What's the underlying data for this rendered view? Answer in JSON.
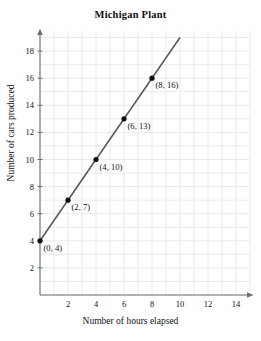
{
  "chart_data": {
    "type": "scatter",
    "title": "Michigan Plant",
    "xlabel": "Number of hours elapsed",
    "ylabel": "Number of cars produced",
    "xlim": [
      0,
      15
    ],
    "ylim": [
      0,
      19.5
    ],
    "grid": true,
    "grid_step": 1,
    "legend": "none",
    "x_ticks": [
      2,
      4,
      6,
      8,
      10,
      12,
      14
    ],
    "y_ticks": [
      2,
      4,
      6,
      8,
      10,
      12,
      14,
      16,
      18
    ],
    "x": [
      0,
      2,
      4,
      6,
      8
    ],
    "y": [
      4,
      7,
      10,
      13,
      16
    ],
    "point_labels": [
      "(0, 4)",
      "(2, 7)",
      "(4, 10)",
      "(6, 13)",
      "(8, 16)"
    ],
    "series": [
      {
        "name": "cars produced",
        "points": [
          {
            "x": 0,
            "y": 4,
            "label": "(0, 4)"
          },
          {
            "x": 2,
            "y": 7,
            "label": "(2, 7)"
          },
          {
            "x": 4,
            "y": 10,
            "label": "(4, 10)"
          },
          {
            "x": 6,
            "y": 13,
            "label": "(6, 13)"
          },
          {
            "x": 8,
            "y": 16,
            "label": "(8, 16)"
          }
        ]
      }
    ],
    "line": {
      "from": {
        "x": 0,
        "y": 4
      },
      "to": {
        "x": 10,
        "y": 19
      }
    },
    "colors": {
      "line": "#555555",
      "marker": "#111111",
      "grid": "#e7eaef",
      "axis": "#6f6f6f",
      "text": "#111111"
    }
  }
}
